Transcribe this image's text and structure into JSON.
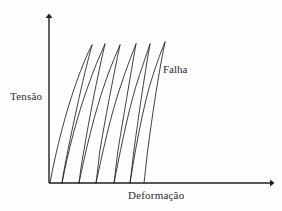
{
  "figure": {
    "background_color": "#fefefe",
    "line_color": "#1f1f1f",
    "text_color": "#2b2b2b"
  },
  "axes": {
    "y_label": "Tensão",
    "x_label": "Deformação",
    "origin": {
      "x": 49,
      "y": 183
    },
    "y_top": {
      "x": 49,
      "y": 14
    },
    "x_right": {
      "x": 275,
      "y": 183
    },
    "arrowheads": true,
    "ticks": false,
    "gridlines": false
  },
  "annotations": [
    {
      "name": "failure-annotation",
      "text": "Falha",
      "x": 163,
      "y": 63
    }
  ],
  "chart_data": {
    "type": "line",
    "title": "",
    "xlabel": "Deformação",
    "ylabel": "Tensão",
    "xlim": [
      0,
      1
    ],
    "ylim": [
      0,
      1
    ],
    "grid": false,
    "legend": null,
    "series": [
      {
        "name": "ciclo-1",
        "kind": "hysteresis-loop",
        "loading_path": "M 50,183 C 56,150 66,110 79,75 C 84,62 88,52 92,45",
        "unloading_path": "M 92,45 C 83,78 74,120 68,150 C 65,165 63,175 62,183"
      },
      {
        "name": "ciclo-2",
        "kind": "hysteresis-loop",
        "loading_path": "M 62,183 C 68,152 78,112 91,78 C 96,64 101,53 105,44",
        "unloading_path": "M 105,44 C 97,78 89,120 84,150 C 81,166 80,176 79,183"
      },
      {
        "name": "ciclo-3",
        "kind": "hysteresis-loop",
        "loading_path": "M 79,183 C 85,154 94,114 106,80 C 111,66 116,54 120,45",
        "unloading_path": "M 120,45 C 113,78 105,120 100,150 C 98,166 97,176 96,183"
      },
      {
        "name": "ciclo-4",
        "kind": "hysteresis-loop",
        "loading_path": "M 96,183 C 102,156 110,116 122,82 C 127,67 132,54 136,44",
        "unloading_path": "M 136,44 C 130,78 123,120 118,150 C 116,166 115,176 114,183"
      },
      {
        "name": "ciclo-5",
        "kind": "hysteresis-loop",
        "loading_path": "M 114,183 C 119,158 126,120 136,86 C 141,70 146,56 150,44",
        "unloading_path": "M 150,44 C 144,78 138,120 134,150 C 132,166 131,176 130,183"
      },
      {
        "name": "ciclo-6-falha",
        "kind": "failure-curve",
        "loading_path": "M 130,183 C 134,158 140,122 149,88 C 155,68 160,54 165,42",
        "unloading_path": "M 165,42 C 158,76 152,118 148,148 C 146,164 145,175 144,183"
      }
    ]
  }
}
